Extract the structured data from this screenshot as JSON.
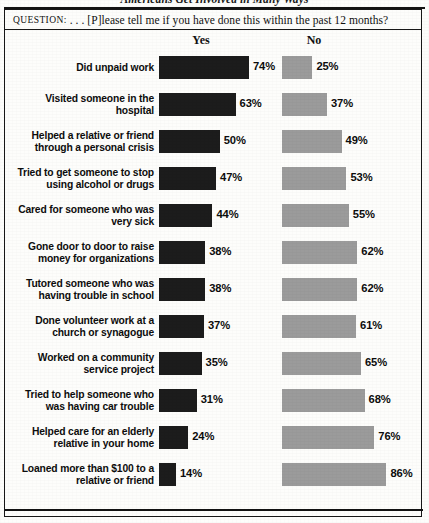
{
  "figure": {
    "title": "Americans Get Involved in Many Ways",
    "question_label": "Question:",
    "question_text": ". . . [P]lease tell me if you have done this within the past 12 months?"
  },
  "columns": {
    "yes_header": "Yes",
    "no_header": "No"
  },
  "colors": {
    "yes_bar": "#1c1c1c",
    "no_bar": "#9b9b9b",
    "text": "#0d0d0d",
    "rule": "#131313",
    "page": "#fdfdfb"
  },
  "chart_data": {
    "type": "bar",
    "orientation": "horizontal",
    "title": "Americans Get Involved in Many Ways",
    "subtitle": "Question: . . . [P]lease tell me if you have done this within the past 12 months?",
    "xlabel": "",
    "ylabel": "",
    "xlim": [
      0,
      100
    ],
    "grid": false,
    "legend_position": "top",
    "value_suffix": "%",
    "categories": [
      "Did unpaid work",
      "Visited someone in the hospital",
      "Helped a relative or friend through a personal crisis",
      "Tried to get someone to stop using alcohol or drugs",
      "Cared for someone who was very sick",
      "Gone door to door to raise money for organizations",
      "Tutored someone who was having trouble in school",
      "Done volunteer work at a church or synagogue",
      "Worked on a community service project",
      "Tried to help someone who was having car trouble",
      "Helped care for an elderly relative in your home",
      "Loaned more than $100 to a relative or friend"
    ],
    "series": [
      {
        "name": "Yes",
        "color": "#1c1c1c",
        "values": [
          74,
          63,
          50,
          47,
          44,
          38,
          38,
          37,
          35,
          31,
          24,
          14
        ]
      },
      {
        "name": "No",
        "color": "#9b9b9b",
        "values": [
          25,
          37,
          49,
          53,
          55,
          62,
          62,
          61,
          65,
          68,
          76,
          86
        ]
      }
    ]
  },
  "rows": [
    {
      "label_lines": [
        "Did unpaid work"
      ],
      "yes": 74,
      "no": 25,
      "yes_text": "74%",
      "no_text": "25%"
    },
    {
      "label_lines": [
        "Visited someone in the",
        "hospital"
      ],
      "yes": 63,
      "no": 37,
      "yes_text": "63%",
      "no_text": "37%"
    },
    {
      "label_lines": [
        "Helped a relative or friend",
        "through a personal crisis"
      ],
      "yes": 50,
      "no": 49,
      "yes_text": "50%",
      "no_text": "49%"
    },
    {
      "label_lines": [
        "Tried to get someone to stop",
        "using alcohol or drugs"
      ],
      "yes": 47,
      "no": 53,
      "yes_text": "47%",
      "no_text": "53%"
    },
    {
      "label_lines": [
        "Cared for someone who was",
        "very sick"
      ],
      "yes": 44,
      "no": 55,
      "yes_text": "44%",
      "no_text": "55%"
    },
    {
      "label_lines": [
        "Gone door to door to raise",
        "money for organizations"
      ],
      "yes": 38,
      "no": 62,
      "yes_text": "38%",
      "no_text": "62%"
    },
    {
      "label_lines": [
        "Tutored someone who was",
        "having trouble in school"
      ],
      "yes": 38,
      "no": 62,
      "yes_text": "38%",
      "no_text": "62%"
    },
    {
      "label_lines": [
        "Done volunteer work at a",
        "church or synagogue"
      ],
      "yes": 37,
      "no": 61,
      "yes_text": "37%",
      "no_text": "61%"
    },
    {
      "label_lines": [
        "Worked on a community",
        "service project"
      ],
      "yes": 35,
      "no": 65,
      "yes_text": "35%",
      "no_text": "65%"
    },
    {
      "label_lines": [
        "Tried to help someone who",
        "was having car trouble"
      ],
      "yes": 31,
      "no": 68,
      "yes_text": "31%",
      "no_text": "68%"
    },
    {
      "label_lines": [
        "Helped care for an elderly",
        "relative in your home"
      ],
      "yes": 24,
      "no": 76,
      "yes_text": "24%",
      "no_text": "76%"
    },
    {
      "label_lines": [
        "Loaned more than $100 to a",
        "relative or friend"
      ],
      "yes": 14,
      "no": 86,
      "yes_text": "14%",
      "no_text": "86%"
    }
  ]
}
